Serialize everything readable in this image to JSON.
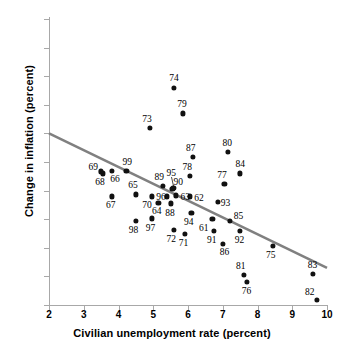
{
  "chart_data": {
    "type": "scatter",
    "title": "",
    "xlabel": "Civilian unemployment rate (percent)",
    "ylabel": "Change in inflation (percent)",
    "xlim": [
      2,
      10
    ],
    "ylim": [
      -4,
      6
    ],
    "xticks": [
      2,
      3,
      4,
      5,
      6,
      7,
      8,
      9,
      10
    ],
    "xticklabels": [
      "2",
      "3",
      "4",
      "5",
      "6",
      "7",
      "8",
      "9",
      "10"
    ],
    "yticks": [
      6,
      5,
      4,
      3,
      2,
      1,
      0,
      -1,
      -2,
      -3,
      -4
    ],
    "yticklabels": [
      "6",
      "",
      "4",
      "3",
      "2",
      "1",
      "0",
      "-1",
      "-2",
      "-3",
      "-4"
    ],
    "grid": false,
    "legend": null,
    "point_color": "#111111",
    "trendline": {
      "color": "#808080",
      "x": [
        2,
        10
      ],
      "y": [
        2.0,
        -2.7
      ]
    },
    "points": [
      {
        "label": "61",
        "x": 6.7,
        "y": -1.0,
        "lx": 6.45,
        "ly": -1.32
      },
      {
        "label": "62",
        "x": 6.05,
        "y": -0.2,
        "lx": 6.32,
        "ly": -0.27
      },
      {
        "label": "63",
        "x": 5.65,
        "y": -0.17,
        "lx": 5.92,
        "ly": -0.22
      },
      {
        "label": "64",
        "x": 5.15,
        "y": -0.42,
        "lx": 5.1,
        "ly": -0.73
      },
      {
        "label": "65",
        "x": 4.5,
        "y": -0.13,
        "lx": 4.42,
        "ly": 0.18
      },
      {
        "label": "66",
        "x": 3.8,
        "y": 0.7,
        "lx": 3.9,
        "ly": 0.4
      },
      {
        "label": "67",
        "x": 3.8,
        "y": -0.2,
        "lx": 3.78,
        "ly": -0.52
      },
      {
        "label": "68",
        "x": 3.55,
        "y": 0.6,
        "lx": 3.47,
        "ly": 0.3
      },
      {
        "label": "69",
        "x": 3.5,
        "y": 0.67,
        "lx": 3.27,
        "ly": 0.82
      },
      {
        "label": "70",
        "x": 4.95,
        "y": -0.2,
        "lx": 4.82,
        "ly": -0.5
      },
      {
        "label": "71",
        "x": 5.9,
        "y": -1.5,
        "lx": 5.87,
        "ly": -1.82
      },
      {
        "label": "72",
        "x": 5.6,
        "y": -1.38,
        "lx": 5.52,
        "ly": -1.7
      },
      {
        "label": "73",
        "x": 4.9,
        "y": 2.2,
        "lx": 4.82,
        "ly": 2.5
      },
      {
        "label": "74",
        "x": 5.6,
        "y": 3.6,
        "lx": 5.6,
        "ly": 3.92
      },
      {
        "label": "75",
        "x": 8.45,
        "y": -1.92,
        "lx": 8.38,
        "ly": -2.25
      },
      {
        "label": "76",
        "x": 7.7,
        "y": -3.2,
        "lx": 7.68,
        "ly": -3.5
      },
      {
        "label": "77",
        "x": 7.05,
        "y": 0.24,
        "lx": 6.98,
        "ly": 0.55
      },
      {
        "label": "78",
        "x": 6.05,
        "y": 0.52,
        "lx": 5.98,
        "ly": 0.83
      },
      {
        "label": "79",
        "x": 5.85,
        "y": 2.7,
        "lx": 5.83,
        "ly": 3.02
      },
      {
        "label": "80",
        "x": 7.15,
        "y": 1.35,
        "lx": 7.13,
        "ly": 1.66
      },
      {
        "label": "81",
        "x": 7.6,
        "y": -2.95,
        "lx": 7.52,
        "ly": -2.65
      },
      {
        "label": "82",
        "x": 9.7,
        "y": -3.82,
        "lx": 9.5,
        "ly": -3.55
      },
      {
        "label": "83",
        "x": 9.6,
        "y": -2.9,
        "lx": 9.58,
        "ly": -2.6
      },
      {
        "label": "84",
        "x": 7.5,
        "y": 0.6,
        "lx": 7.5,
        "ly": 0.92
      },
      {
        "label": "85",
        "x": 7.2,
        "y": -1.05,
        "lx": 7.45,
        "ly": -0.9
      },
      {
        "label": "86",
        "x": 7.0,
        "y": -1.85,
        "lx": 7.05,
        "ly": -2.15
      },
      {
        "label": "87",
        "x": 6.15,
        "y": 1.18,
        "lx": 6.08,
        "ly": 1.5
      },
      {
        "label": "88",
        "x": 5.5,
        "y": -0.45,
        "lx": 5.48,
        "ly": -0.77
      },
      {
        "label": "89",
        "x": 5.27,
        "y": 0.17,
        "lx": 5.17,
        "ly": 0.48
      },
      {
        "label": "90",
        "x": 5.55,
        "y": 0.05,
        "lx": 5.72,
        "ly": 0.3
      },
      {
        "label": "91",
        "x": 6.75,
        "y": -1.4,
        "lx": 6.68,
        "ly": -1.72
      },
      {
        "label": "92",
        "x": 7.5,
        "y": -1.42,
        "lx": 7.48,
        "ly": -1.74
      },
      {
        "label": "93",
        "x": 6.85,
        "y": -0.4,
        "lx": 7.08,
        "ly": -0.42
      },
      {
        "label": "94",
        "x": 6.1,
        "y": -0.78,
        "lx": 6.02,
        "ly": -1.1
      },
      {
        "label": "95",
        "x": 5.58,
        "y": 0.08,
        "lx": 5.52,
        "ly": 0.62
      },
      {
        "label": "96",
        "x": 5.4,
        "y": -0.2,
        "lx": 5.22,
        "ly": -0.22
      },
      {
        "label": "97",
        "x": 4.95,
        "y": -0.97,
        "lx": 4.92,
        "ly": -1.3
      },
      {
        "label": "98",
        "x": 4.5,
        "y": -1.05,
        "lx": 4.43,
        "ly": -1.38
      },
      {
        "label": "99",
        "x": 4.23,
        "y": 0.68,
        "lx": 4.25,
        "ly": 0.99
      }
    ],
    "leaders": [
      {
        "x0": 5.52,
        "y0": 0.48,
        "x1": 5.58,
        "y1": 0.15
      }
    ]
  }
}
